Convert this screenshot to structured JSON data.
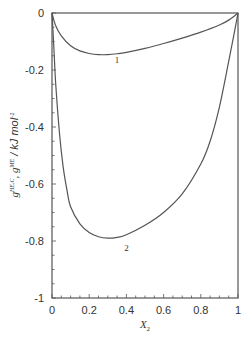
{
  "chart_data": {
    "type": "line",
    "title": "",
    "xlabel": "X2",
    "xlabel_main": "X",
    "xlabel_sub": "2",
    "ylabel": "g^{HE,C}, g^{ME} / kJ mol^-1",
    "ylabel_parts": {
      "g1": "g",
      "sup1": "HE,C",
      "sep": ", ",
      "g2": "g",
      "sup2": "ME",
      "unit": " / kJ mol",
      "unit_sup": "-1"
    },
    "xlim": [
      0,
      1
    ],
    "ylim": [
      -1,
      0
    ],
    "grid": false,
    "legend": "none (curves labeled inline)",
    "x_ticks": [
      "0",
      "0.2",
      "0.4",
      "0.6",
      "0.8",
      "1"
    ],
    "y_ticks": [
      "0",
      "-0.2",
      "-0.4",
      "-0.6",
      "-0.8",
      "-1"
    ],
    "x_tick_values": [
      0,
      0.2,
      0.4,
      0.6,
      0.8,
      1
    ],
    "y_tick_values": [
      0,
      -0.2,
      -0.4,
      -0.6,
      -0.8,
      -1
    ],
    "series": [
      {
        "name": "1",
        "label_pos": {
          "x": 0.35,
          "y": -0.175
        },
        "x": [
          0,
          0.02,
          0.05,
          0.1,
          0.15,
          0.2,
          0.25,
          0.3,
          0.35,
          0.4,
          0.5,
          0.6,
          0.7,
          0.8,
          0.9,
          0.95,
          1
        ],
        "values": [
          0,
          -0.045,
          -0.08,
          -0.115,
          -0.133,
          -0.142,
          -0.146,
          -0.146,
          -0.143,
          -0.138,
          -0.124,
          -0.107,
          -0.088,
          -0.067,
          -0.042,
          -0.025,
          0
        ]
      },
      {
        "name": "2",
        "label_pos": {
          "x": 0.4,
          "y": -0.835
        },
        "x": [
          0,
          0.01,
          0.02,
          0.04,
          0.06,
          0.08,
          0.1,
          0.15,
          0.2,
          0.25,
          0.3,
          0.35,
          0.4,
          0.5,
          0.6,
          0.7,
          0.8,
          0.85,
          0.9,
          0.95,
          0.98,
          1
        ],
        "values": [
          0,
          -0.12,
          -0.25,
          -0.42,
          -0.54,
          -0.62,
          -0.68,
          -0.74,
          -0.77,
          -0.785,
          -0.79,
          -0.787,
          -0.778,
          -0.745,
          -0.7,
          -0.635,
          -0.53,
          -0.45,
          -0.33,
          -0.17,
          -0.07,
          0
        ]
      }
    ]
  }
}
